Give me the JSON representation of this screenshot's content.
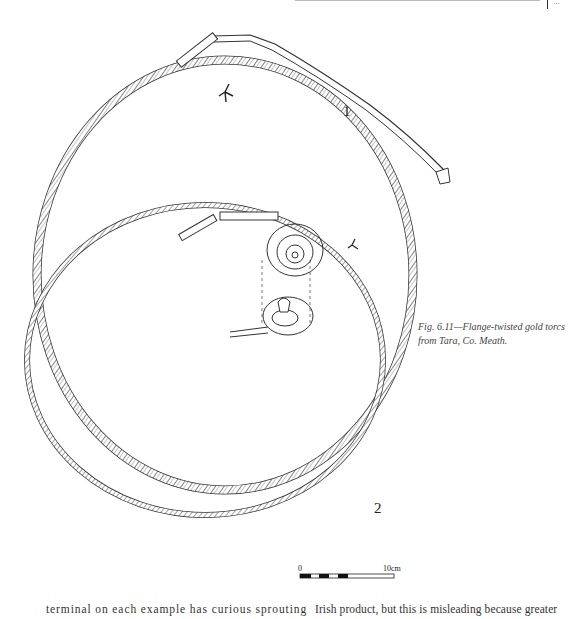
{
  "page": {
    "header_rule": true,
    "page_number_fragment": "..."
  },
  "figure": {
    "label_1": "1",
    "label_2": "2",
    "caption": "Fig. 6.11—Flange-twisted gold torcs from Tara, Co. Meath.",
    "scale_bar": {
      "start_label": "0",
      "end_label": "10cm"
    },
    "colors": {
      "ink": "#333333",
      "background": "#ffffff"
    }
  },
  "body_text": {
    "left_column_line": "terminal on each example has curious sprouting",
    "right_column_line": "Irish product, but this is misleading because greater"
  }
}
